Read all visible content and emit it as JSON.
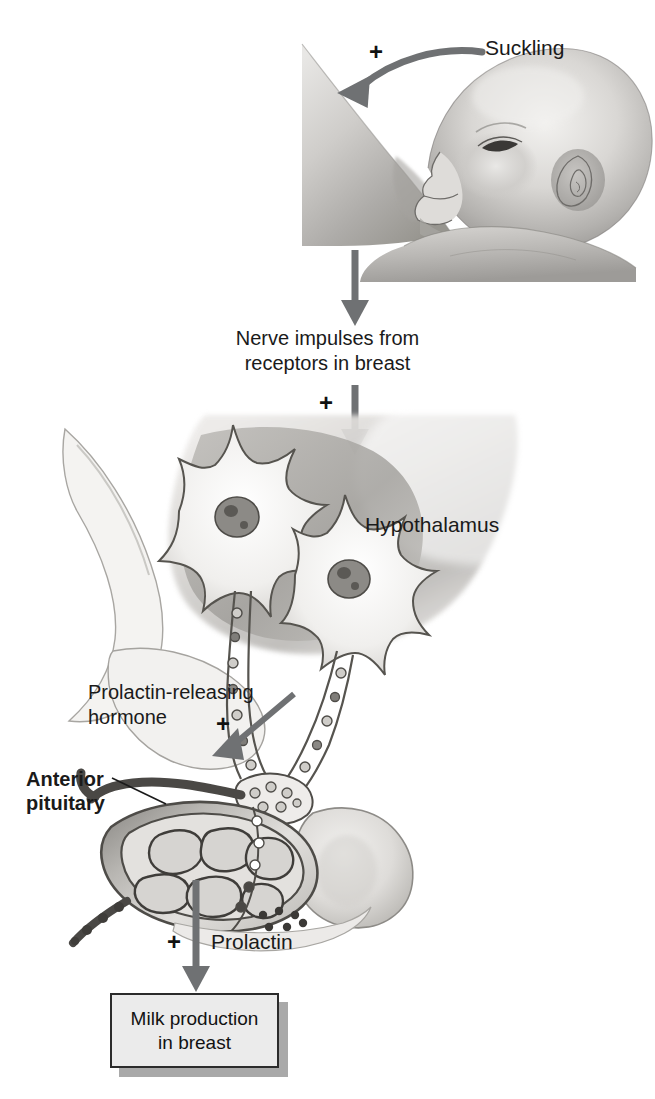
{
  "diagram": {
    "palette": {
      "arrow_gray": "#6f7173",
      "arrow_dark": "#5d6063",
      "text": "#1a1a1a",
      "box_fill": "#ebebeb",
      "box_border": "#2b2b2b",
      "box_shadow": "#a9a9a9",
      "tissue_light": "#efeeec",
      "tissue_mid": "#c9c7c4",
      "tissue_dark": "#8e8c89",
      "outline": "#4a4846"
    },
    "labels": {
      "suckling": "Suckling",
      "nerve_impulses": "Nerve impulses from\nreceptors in breast",
      "nerve_impulses_line1": "Nerve impulses from",
      "nerve_impulses_line2": "receptors in breast",
      "hypothalamus": "Hypothalamus",
      "prolactin_releasing_hormone": "Prolactin-releasing\nhormone",
      "prh_line1": "Prolactin-releasing",
      "prh_line2": "hormone",
      "anterior_pituitary": "Anterior\npituitary",
      "anterior_pituitary_line1": "Anterior",
      "anterior_pituitary_line2": "pituitary",
      "prolactin": "Prolactin",
      "milk_production": "Milk production\nin breast",
      "milk_line1": "Milk production",
      "milk_line2": "in breast"
    },
    "plus_signs": {
      "suckling_plus": "+",
      "hypothalamus_plus": "+",
      "pituitary_plus": "+",
      "prolactin_plus": "+"
    },
    "illustrations": {
      "baby_nursing": "grayscale-drawing-infant-suckling-breast",
      "brain_sagittal": "grayscale-drawing-hypothalamus-neurons-anterior-pituitary"
    }
  }
}
